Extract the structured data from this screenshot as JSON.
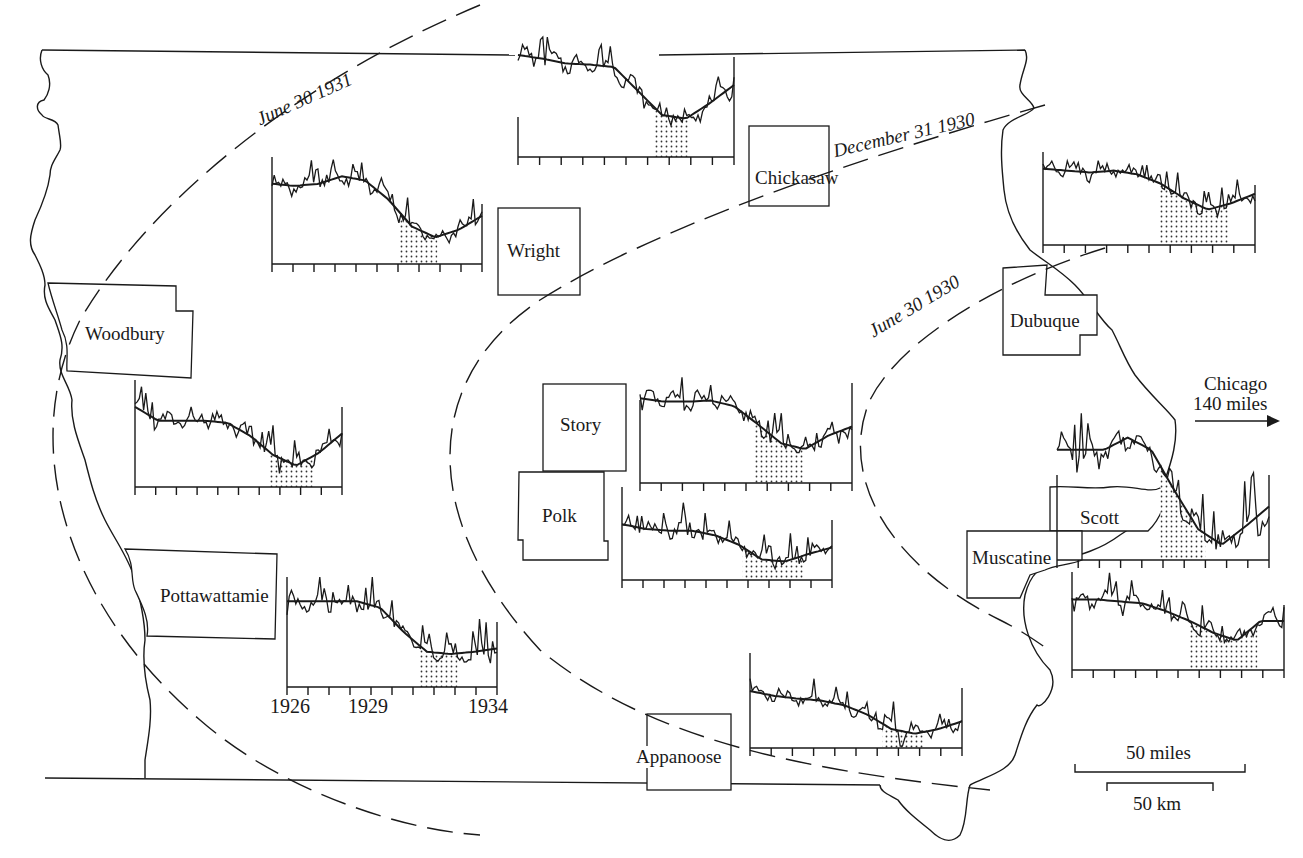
{
  "figure": {
    "type": "map_with_inset_time_series",
    "ink_color": "#1a1a1a",
    "background": "#ffffff"
  },
  "counties": [
    {
      "name": "Woodbury"
    },
    {
      "name": "Pottawattamie"
    },
    {
      "name": "Wright"
    },
    {
      "name": "Chickasaw"
    },
    {
      "name": "Story"
    },
    {
      "name": "Polk"
    },
    {
      "name": "Appanoose"
    },
    {
      "name": "Dubuque"
    },
    {
      "name": "Scott"
    },
    {
      "name": "Muscatine"
    }
  ],
  "isolines": [
    {
      "label": "June 30 1931"
    },
    {
      "label": "December 31 1930"
    },
    {
      "label": "June 30 1930"
    }
  ],
  "annotation": {
    "chicago_line1": "Chicago",
    "chicago_line2": "140 miles",
    "arrow": "right-arrow"
  },
  "scale": {
    "miles_label": "50 miles",
    "km_label": "50 km"
  },
  "axis": {
    "ticks": [
      "1926",
      "1929",
      "1934"
    ],
    "tick_count": 10
  },
  "chart_data": [
    {
      "type": "line",
      "title": "Wright (top center)",
      "x_range": [
        1926,
        1934
      ],
      "shade_start": 1931.0,
      "shade_end": 1932.3,
      "trend": [
        0.85,
        0.82,
        0.78,
        0.77,
        0.75,
        0.55,
        0.35,
        0.32,
        0.45,
        0.6
      ]
    },
    {
      "type": "line",
      "title": "Wright/Kossuth (upper left)",
      "x_range": [
        1926,
        1934
      ],
      "shade_start": 1930.8,
      "shade_end": 1932.3,
      "trend": [
        0.75,
        0.73,
        0.75,
        0.82,
        0.78,
        0.6,
        0.35,
        0.25,
        0.32,
        0.45
      ]
    },
    {
      "type": "line",
      "title": "Dubuque",
      "x_range": [
        1926,
        1934
      ],
      "shade_start": 1930.4,
      "shade_end": 1933.0,
      "trend": [
        0.82,
        0.8,
        0.78,
        0.8,
        0.76,
        0.66,
        0.5,
        0.38,
        0.45,
        0.55
      ]
    },
    {
      "type": "line",
      "title": "Woodbury",
      "x_range": [
        1926,
        1934
      ],
      "shade_start": 1931.2,
      "shade_end": 1932.9,
      "trend": [
        0.75,
        0.62,
        0.62,
        0.62,
        0.6,
        0.48,
        0.3,
        0.2,
        0.32,
        0.5
      ]
    },
    {
      "type": "line",
      "title": "Story",
      "x_range": [
        1926,
        1934
      ],
      "shade_start": 1930.3,
      "shade_end": 1932.2,
      "trend": [
        0.75,
        0.72,
        0.72,
        0.73,
        0.68,
        0.52,
        0.35,
        0.3,
        0.42,
        0.5
      ]
    },
    {
      "type": "line",
      "title": "Polk",
      "x_range": [
        1926,
        1934
      ],
      "shade_start": 1930.6,
      "shade_end": 1932.9,
      "trend": [
        0.6,
        0.55,
        0.53,
        0.53,
        0.48,
        0.38,
        0.22,
        0.2,
        0.28,
        0.35
      ]
    },
    {
      "type": "line",
      "title": "Pottawattamie",
      "x_range": [
        1926,
        1934
      ],
      "x_ticks": [
        "1926",
        "1929",
        "1934"
      ],
      "shade_start": 1931.0,
      "shade_end": 1932.5,
      "trend": [
        0.78,
        0.78,
        0.78,
        0.78,
        0.72,
        0.5,
        0.32,
        0.3,
        0.32,
        0.35
      ]
    },
    {
      "type": "line",
      "title": "Scott",
      "x_range": [
        1926,
        1934
      ],
      "shade_start": 1929.9,
      "shade_end": 1931.6,
      "trend": [
        0.72,
        0.72,
        0.72,
        0.8,
        0.72,
        0.45,
        0.2,
        0.1,
        0.22,
        0.35
      ]
    },
    {
      "type": "line",
      "title": "Muscatine",
      "x_range": [
        1926,
        1934
      ],
      "shade_start": 1930.4,
      "shade_end": 1933.0,
      "trend": [
        0.72,
        0.72,
        0.7,
        0.68,
        0.6,
        0.5,
        0.38,
        0.3,
        0.5,
        0.5
      ]
    },
    {
      "type": "line",
      "title": "Appanoose",
      "x_range": [
        1926,
        1934
      ],
      "shade_start": 1931.0,
      "shade_end": 1932.6,
      "trend": [
        0.6,
        0.55,
        0.52,
        0.5,
        0.45,
        0.35,
        0.2,
        0.15,
        0.2,
        0.28
      ]
    }
  ]
}
